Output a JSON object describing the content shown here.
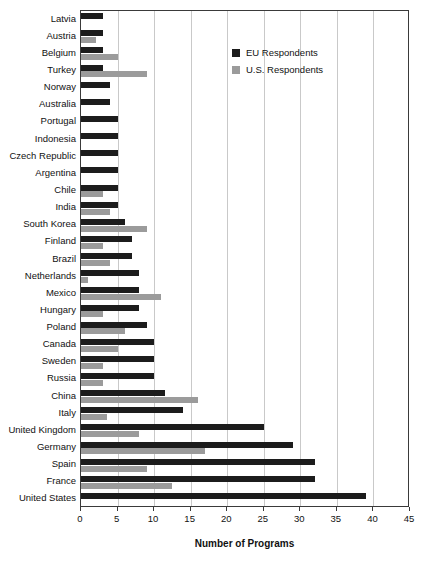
{
  "chart_data": {
    "type": "bar",
    "orientation": "horizontal",
    "title": "",
    "xlabel": "Number of Programs",
    "ylabel": "",
    "xlim": [
      0,
      45
    ],
    "xticks": [
      0,
      5,
      10,
      15,
      20,
      25,
      30,
      35,
      40,
      45
    ],
    "grid": "vertical",
    "legend_position": "top-right",
    "categories": [
      "Latvia",
      "Austria",
      "Belgium",
      "Turkey",
      "Norway",
      "Australia",
      "Portugal",
      "Indonesia",
      "Czech Republic",
      "Argentina",
      "Chile",
      "India",
      "South Korea",
      "Finland",
      "Brazil",
      "Netherlands",
      "Mexico",
      "Hungary",
      "Poland",
      "Canada",
      "Sweden",
      "Russia",
      "China",
      "Italy",
      "United Kingdom",
      "Germany",
      "Spain",
      "France",
      "United States"
    ],
    "series": [
      {
        "name": "EU Respondents",
        "color": "#1c1c1c",
        "values": [
          3,
          3,
          3,
          3,
          4,
          4,
          5,
          5,
          5,
          5,
          5,
          5,
          6,
          7,
          7,
          8,
          8,
          8,
          9,
          10,
          10,
          10,
          11.5,
          14,
          25,
          29,
          32,
          32,
          39
        ]
      },
      {
        "name": "U.S. Respondents",
        "color": "#9b9b9b",
        "values": [
          0,
          2,
          5,
          9,
          0,
          0,
          0,
          0,
          0,
          0,
          3,
          4,
          9,
          3,
          4,
          1,
          11,
          3,
          6,
          5,
          3,
          3,
          16,
          3.5,
          8,
          17,
          9,
          12.5,
          0
        ]
      }
    ]
  },
  "legend": {
    "items": [
      {
        "label": "EU Respondents",
        "color": "#1c1c1c"
      },
      {
        "label": "U.S. Respondents",
        "color": "#9b9b9b"
      }
    ]
  }
}
